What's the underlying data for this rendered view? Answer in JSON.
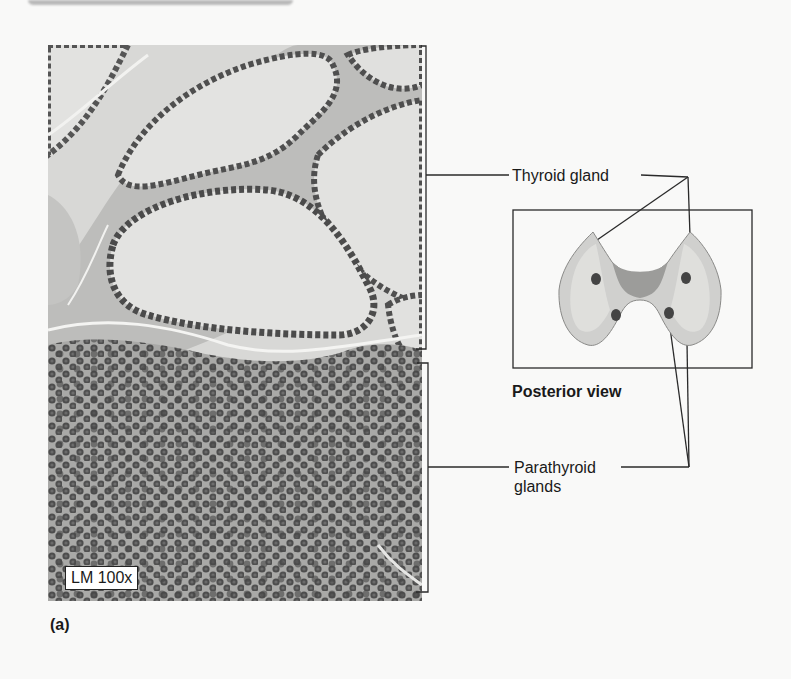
{
  "figure": {
    "panel_label": "(a)",
    "magnification_label": "LM 100x",
    "callouts": {
      "thyroid": "Thyroid gland",
      "parathyroid_line1": "Parathyroid",
      "parathyroid_line2": "glands"
    },
    "inset": {
      "caption": "Posterior view"
    }
  },
  "colors": {
    "background": "#f9f9f8",
    "colloid": "#d9d9d7",
    "nuclei": "#4a4a4a",
    "line": "#2a2a2a"
  }
}
